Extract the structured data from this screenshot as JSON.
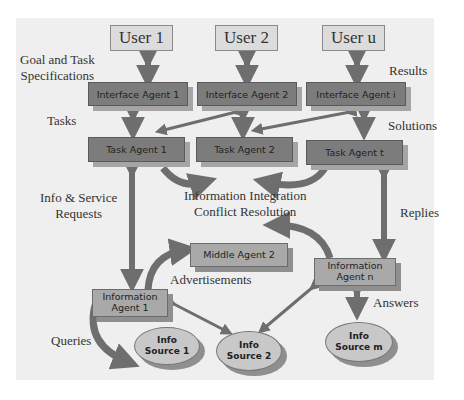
{
  "users": [
    "User 1",
    "User 2",
    "User u"
  ],
  "interface_agents": [
    "Interface Agent 1",
    "Interface Agent 2",
    "Interface Agent i"
  ],
  "task_agents": [
    "Task Agent 1",
    "Task Agent 2",
    "Task Agent t"
  ],
  "middle_agent": "Middle Agent 2",
  "information_agents": [
    {
      "line1": "Information",
      "line2": "Agent 1"
    },
    {
      "line1": "Information",
      "line2": "Agent n"
    }
  ],
  "info_sources": [
    {
      "line1": "Info",
      "line2": "Source 1"
    },
    {
      "line1": "Info",
      "line2": "Source 2"
    },
    {
      "line1": "Info",
      "line2": "Source m"
    }
  ],
  "labels": {
    "goal_line1": "Goal and Task",
    "goal_line2": "Specifications",
    "results": "Results",
    "tasks": "Tasks",
    "solutions": "Solutions",
    "info_service_line1": "Info & Service",
    "info_service_line2": "Requests",
    "integration_line1": "Information Integration",
    "integration_line2": "Conflict Resolution",
    "replies": "Replies",
    "advertisements": "Advertisements",
    "answers": "Answers",
    "queries": "Queries"
  }
}
